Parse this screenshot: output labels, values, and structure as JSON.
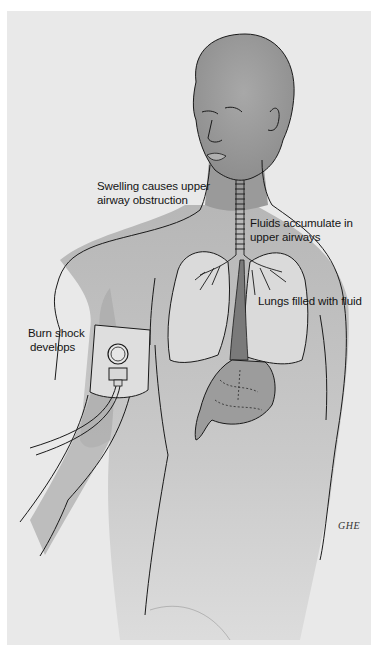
{
  "figure": {
    "colors": {
      "paper": "#e9e9e9",
      "background": "#ffffff",
      "skin_shade": "#9c9c9c",
      "organ_fill": "#dcdcdc",
      "line": "#1a1a1a"
    },
    "labels": [
      {
        "id": "swelling",
        "line1": "Swelling causes upper",
        "line2": "airway obstruction"
      },
      {
        "id": "fluids",
        "line1": "Fluids accumulate in",
        "line2": "upper airways"
      },
      {
        "id": "lungs",
        "line1": "Lungs filled with fluid"
      },
      {
        "id": "burn",
        "line1": "Burn shock",
        "line2": "develops"
      }
    ],
    "signature": "GHE"
  }
}
